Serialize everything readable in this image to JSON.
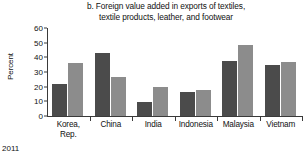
{
  "chart_data": {
    "type": "bar",
    "title": "b. Foreign value added in exports of textiles, textile products, leather, and footwear",
    "title_lines": [
      "b. Foreign value added in exports of textiles,",
      "textile products, leather, and footwear"
    ],
    "xlabel": "",
    "ylabel": "Percent",
    "ylim": [
      0,
      60
    ],
    "yticks": [
      0,
      10,
      20,
      30,
      40,
      50,
      60
    ],
    "ytick_labels": [
      "0",
      "10",
      "20",
      "30",
      "40",
      "50",
      "60"
    ],
    "grid": false,
    "legend": "none",
    "categories": [
      "Korea, Rep.",
      "China",
      "India",
      "Indonesia",
      "Malaysia",
      "Vietnam"
    ],
    "category_lines": [
      [
        "Korea,",
        "Rep."
      ],
      [
        "China"
      ],
      [
        "India"
      ],
      [
        "Indonesia"
      ],
      [
        "Malaysia"
      ],
      [
        "Vietnam"
      ]
    ],
    "series": [
      {
        "name": "series-1",
        "color": "#4b4b4b",
        "values": [
          21.5,
          43.0,
          9.5,
          16.5,
          37.3,
          35.0
        ]
      },
      {
        "name": "series-2",
        "color": "#8c8c8c",
        "values": [
          36.0,
          26.5,
          19.5,
          18.0,
          48.7,
          37.0
        ]
      }
    ]
  },
  "footnote": "2011"
}
